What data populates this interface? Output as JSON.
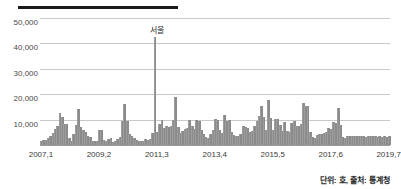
{
  "chart_data": {
    "type": "bar",
    "title": "",
    "subtitle": "",
    "xlabel": "",
    "ylabel": "",
    "ylim": [
      0,
      50000
    ],
    "ytick_labels": [
      "10,000",
      "20,000",
      "30,000",
      "40,000",
      "50,000"
    ],
    "ytick_values": [
      10000,
      20000,
      30000,
      40000,
      50000
    ],
    "grid": true,
    "legend": "none",
    "bar_color": "#8b8b8b",
    "annotations": [
      {
        "label": "서울",
        "x_index": 50,
        "value": 42500
      }
    ],
    "xtick_labels": [
      "2007,1",
      "2009,2",
      "2011,3",
      "2013,4",
      "2015,5",
      "2017,6",
      "2019,7"
    ],
    "xtick_indices": [
      0,
      25,
      50,
      75,
      100,
      125,
      150
    ],
    "categories": [
      "2007,1",
      "2007,2",
      "2007,3",
      "2007,4",
      "2007,5",
      "2007,6",
      "2007,7",
      "2007,8",
      "2007,9",
      "2007,10",
      "2007,11",
      "2007,12",
      "2008,1",
      "2008,2",
      "2008,3",
      "2008,4",
      "2008,5",
      "2008,6",
      "2008,7",
      "2008,8",
      "2008,9",
      "2008,10",
      "2008,11",
      "2008,12",
      "2009,1",
      "2009,2",
      "2009,3",
      "2009,4",
      "2009,5",
      "2009,6",
      "2009,7",
      "2009,8",
      "2009,9",
      "2009,10",
      "2009,11",
      "2009,12",
      "2010,1",
      "2010,2",
      "2010,3",
      "2010,4",
      "2010,5",
      "2010,6",
      "2010,7",
      "2010,8",
      "2010,9",
      "2010,10",
      "2010,11",
      "2010,12",
      "2011,1",
      "2011,2",
      "2011,3",
      "2011,4",
      "2011,5",
      "2011,6",
      "2011,7",
      "2011,8",
      "2011,9",
      "2011,10",
      "2011,11",
      "2011,12",
      "2012,1",
      "2012,2",
      "2012,3",
      "2012,4",
      "2012,5",
      "2012,6",
      "2012,7",
      "2012,8",
      "2012,9",
      "2012,10",
      "2012,11",
      "2012,12",
      "2013,1",
      "2013,2",
      "2013,3",
      "2013,4",
      "2013,5",
      "2013,6",
      "2013,7",
      "2013,8",
      "2013,9",
      "2013,10",
      "2013,11",
      "2013,12",
      "2014,1",
      "2014,2",
      "2014,3",
      "2014,4",
      "2014,5",
      "2014,6",
      "2014,7",
      "2014,8",
      "2014,9",
      "2014,10",
      "2014,11",
      "2014,12",
      "2015,1",
      "2015,2",
      "2015,3",
      "2015,4",
      "2015,5",
      "2015,6",
      "2015,7",
      "2015,8",
      "2015,9",
      "2015,10",
      "2015,11",
      "2015,12",
      "2016,1",
      "2016,2",
      "2016,3",
      "2016,4",
      "2016,5",
      "2016,6",
      "2016,7",
      "2016,8",
      "2016,9",
      "2016,10",
      "2016,11",
      "2016,12",
      "2017,1",
      "2017,2",
      "2017,3",
      "2017,4",
      "2017,5",
      "2017,6",
      "2017,7",
      "2017,8",
      "2017,9",
      "2017,10",
      "2017,11",
      "2017,12",
      "2018,1",
      "2018,2",
      "2018,3",
      "2018,4",
      "2018,5",
      "2018,6",
      "2018,7",
      "2018,8",
      "2018,9",
      "2018,10",
      "2018,11",
      "2018,12",
      "2019,1",
      "2019,2",
      "2019,3",
      "2019,4",
      "2019,5",
      "2019,6",
      "2019,7"
    ],
    "values": [
      1500,
      1800,
      2000,
      2600,
      3500,
      4800,
      6200,
      7300,
      12500,
      11200,
      8300,
      8200,
      2700,
      1600,
      4200,
      7900,
      14100,
      7100,
      6000,
      5200,
      3400,
      3000,
      1500,
      1400,
      1500,
      5800,
      6000,
      2100,
      1500,
      2400,
      2800,
      1300,
      1500,
      2200,
      3300,
      9300,
      16200,
      9400,
      4300,
      3400,
      2800,
      1800,
      1500,
      1400,
      1500,
      2400,
      2000,
      2500,
      4800,
      42500,
      5000,
      8200,
      10000,
      6800,
      7300,
      7200,
      7500,
      9700,
      18900,
      7100,
      4700,
      5400,
      6200,
      6700,
      9800,
      7400,
      6200,
      9700,
      9400,
      6000,
      4400,
      3000,
      2800,
      4200,
      5800,
      10300,
      9900,
      6100,
      4900,
      11900,
      9500,
      9900,
      5100,
      3800,
      3600,
      3600,
      4500,
      7300,
      7000,
      6800,
      5000,
      5400,
      7400,
      9400,
      11300,
      15500,
      10900,
      6000,
      17900,
      10700,
      5800,
      10400,
      10100,
      7800,
      5600,
      9100,
      5400,
      5000,
      8700,
      9300,
      7500,
      7500,
      8100,
      16600,
      15500,
      15300,
      5100,
      3200,
      2600,
      4100,
      4200,
      4400,
      4700,
      5000,
      6600,
      6300,
      8900,
      8700,
      14400,
      7800,
      3100,
      2600,
      3500,
      3600,
      3600,
      3700,
      3500,
      3600,
      3500,
      3400,
      3300,
      3400,
      3500,
      3400,
      3400,
      3300,
      3400,
      3300,
      3400,
      3300,
      3400
    ]
  },
  "footer": {
    "source_note": "단위: 호, 출처: 통계청"
  }
}
